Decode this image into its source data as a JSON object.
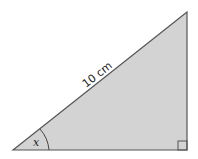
{
  "diagram": {
    "type": "right-triangle",
    "hypotenuse_label": "10 cm",
    "angle_label": "x",
    "fill_color": "#d3d3d3",
    "stroke_color": "#555555",
    "right_angle_marker": true
  }
}
